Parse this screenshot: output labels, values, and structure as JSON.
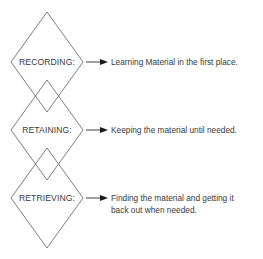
{
  "diagram": {
    "stages": [
      {
        "label": "RECORDING:",
        "description_lines": [
          "Learning Material in the first place."
        ]
      },
      {
        "label": "RETAINING:",
        "description_lines": [
          "Keeping the material until needed."
        ]
      },
      {
        "label": "RETRIEVING:",
        "description_lines": [
          "Finding the material and getting it",
          "back out when needed."
        ]
      }
    ],
    "colors": {
      "diamond_stroke": "#6e6e6e",
      "text": "#3a3a3a",
      "arrow": "#1a1a1a",
      "background": "#ffffff"
    }
  }
}
